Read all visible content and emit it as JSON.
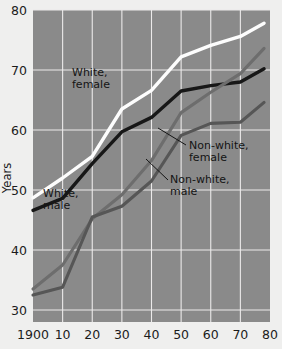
{
  "chart_data": {
    "type": "line",
    "title": "",
    "xlabel": "",
    "ylabel": "Years",
    "xlim": [
      1900,
      1980
    ],
    "ylim": [
      28,
      80
    ],
    "grid": true,
    "legend_position": "inline-annotations",
    "x": [
      1900,
      1910,
      1920,
      1930,
      1940,
      1950,
      1960,
      1970,
      1978
    ],
    "xtick_labels": [
      "1900",
      "10",
      "20",
      "30",
      "40",
      "50",
      "60",
      "70",
      "80"
    ],
    "ytick_labels": [
      "80",
      "70",
      "60",
      "50",
      "40",
      "30"
    ],
    "ytick_values": [
      80,
      70,
      60,
      50,
      40,
      30
    ],
    "series": [
      {
        "name": "White, female",
        "color": "#fdfdfd",
        "values": [
          48.7,
          52.0,
          55.6,
          63.5,
          66.6,
          72.2,
          74.1,
          75.6,
          77.8
        ]
      },
      {
        "name": "White, male",
        "color": "#171717",
        "values": [
          46.6,
          48.6,
          54.4,
          59.7,
          62.1,
          66.5,
          67.4,
          68.0,
          70.2
        ]
      },
      {
        "name": "Non-white, female",
        "color": "#6d6d6d",
        "values": [
          33.5,
          37.5,
          45.2,
          49.2,
          54.9,
          62.9,
          66.3,
          69.4,
          73.6
        ]
      },
      {
        "name": "Non-white, male",
        "color": "#565656",
        "values": [
          32.5,
          33.8,
          45.5,
          47.3,
          51.5,
          59.1,
          61.1,
          61.3,
          64.6
        ]
      }
    ],
    "annotations": [
      {
        "name": "white-female",
        "text_line1": "White,",
        "text_line2": "female"
      },
      {
        "name": "white-male",
        "text_line1": "White,",
        "text_line2": "male"
      },
      {
        "name": "nonwhite-female",
        "text_line1": "Non-white,",
        "text_line2": "female"
      },
      {
        "name": "nonwhite-male",
        "text_line1": "Non-white,",
        "text_line2": "male"
      }
    ],
    "plot_background_color": "#8a8a8a",
    "grid_color": "#eceaea",
    "page_background_color": "#efefee"
  }
}
